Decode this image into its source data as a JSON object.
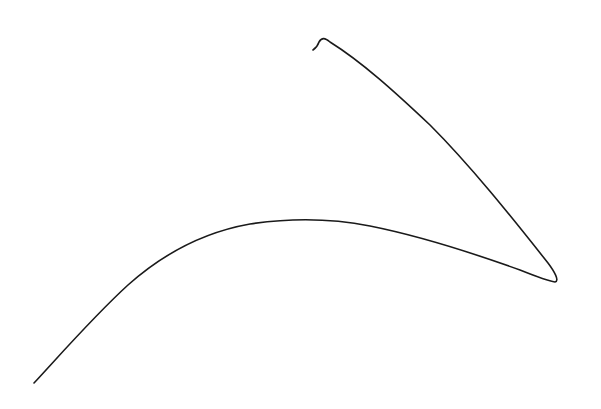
{
  "canvas": {
    "background": "#ffffff"
  },
  "stroke": {
    "color": "#1a1a1a",
    "description": "single freehand ink stroke"
  }
}
